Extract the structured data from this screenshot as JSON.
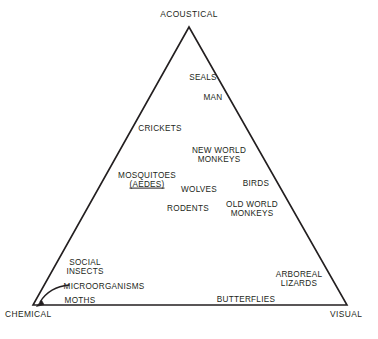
{
  "diagram": {
    "line_color": "#231f20",
    "text_color": "#231f20",
    "background": "#ffffff",
    "corners": [
      {
        "id": "acoustical",
        "label": "ACOUSTICAL",
        "x": 189,
        "y": 14
      },
      {
        "id": "chemical",
        "label": "CHEMICAL",
        "x": 5,
        "y": 314
      },
      {
        "id": "visual",
        "label": "VISUAL",
        "x": 330,
        "y": 314
      }
    ],
    "vertices": {
      "apex": {
        "x": 189,
        "y": 27
      },
      "bottom_left": {
        "x": 33,
        "y": 305
      },
      "bottom_right": {
        "x": 347,
        "y": 305
      }
    },
    "items": [
      {
        "id": "seals",
        "label": "SEALS",
        "x": 203,
        "y": 78,
        "lines": [
          "SEALS"
        ]
      },
      {
        "id": "man",
        "label": "MAN",
        "x": 213,
        "y": 98,
        "lines": [
          "MAN"
        ]
      },
      {
        "id": "crickets",
        "label": "CRICKETS",
        "x": 160,
        "y": 129,
        "lines": [
          "CRICKETS"
        ]
      },
      {
        "id": "new-world-monkeys",
        "label": "NEW WORLD MONKEYS",
        "x": 219,
        "y": 155,
        "lines": [
          "NEW WORLD",
          "MONKEYS"
        ]
      },
      {
        "id": "mosquitoes-aedes",
        "label": "MOSQUITOES (AEDES)",
        "x": 147,
        "y": 180,
        "lines": [
          "MOSQUITOES",
          "(AEDES)"
        ]
      },
      {
        "id": "wolves",
        "label": "WOLVES",
        "x": 199,
        "y": 190,
        "lines": [
          "WOLVES"
        ]
      },
      {
        "id": "birds",
        "label": "BIRDS",
        "x": 256,
        "y": 184,
        "lines": [
          "BIRDS"
        ]
      },
      {
        "id": "rodents",
        "label": "RODENTS",
        "x": 188,
        "y": 209,
        "lines": [
          "RODENTS"
        ]
      },
      {
        "id": "old-world-monkeys",
        "label": "OLD WORLD MONKEYS",
        "x": 252,
        "y": 209,
        "lines": [
          "OLD WORLD",
          "MONKEYS"
        ]
      },
      {
        "id": "social-insects",
        "label": "SOCIAL INSECTS",
        "x": 85,
        "y": 267,
        "lines": [
          "SOCIAL",
          "INSECTS"
        ]
      },
      {
        "id": "microorganisms",
        "label": "MICROORGANISMS",
        "x": 104,
        "y": 287,
        "lines": [
          "MICROORGANISMS"
        ]
      },
      {
        "id": "moths",
        "label": "MOTHS",
        "x": 80,
        "y": 301,
        "lines": [
          "MOTHS"
        ]
      },
      {
        "id": "arboreal-lizards",
        "label": "ARBOREAL LIZARDS",
        "x": 299,
        "y": 279,
        "lines": [
          "ARBOREAL",
          "LIZARDS"
        ]
      },
      {
        "id": "butterflies",
        "label": "BUTTERFLIES",
        "x": 246,
        "y": 300,
        "lines": [
          "BUTTERFLIES"
        ]
      }
    ],
    "annotations": [
      {
        "id": "microorganisms-arrow",
        "kind": "curved-arrow",
        "from": "microorganisms",
        "to": "chemical",
        "path": "M 69 285 C 58 286, 46 292, 39 303",
        "arrow_tip": {
          "x": 37,
          "y": 306
        }
      }
    ]
  }
}
